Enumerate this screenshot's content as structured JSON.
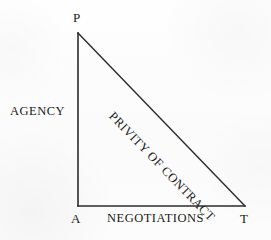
{
  "diagram": {
    "background_color": "#fdfdfd",
    "line_color": "#2b2b2b",
    "text_color": "#1a1a1a",
    "vertices": [
      {
        "id": "p",
        "label": "P",
        "x": 78,
        "y": 33,
        "meaning": "Principal"
      },
      {
        "id": "a",
        "label": "A",
        "x": 78,
        "y": 206,
        "meaning": "Agent"
      },
      {
        "id": "t",
        "label": "T",
        "x": 245,
        "y": 206,
        "meaning": "Third party"
      }
    ],
    "sides": [
      {
        "id": "vertical",
        "label": "AGENCY",
        "from": "p",
        "to": "a",
        "orientation": "vertical"
      },
      {
        "id": "horizontal",
        "label": "NEGOTIATIONS",
        "from": "a",
        "to": "t",
        "orientation": "horizontal"
      },
      {
        "id": "hypotenuse",
        "label": "PRIVITY OF CONTRACT",
        "from": "p",
        "to": "t",
        "orientation": "diagonal",
        "rotation_deg": 46
      }
    ]
  }
}
